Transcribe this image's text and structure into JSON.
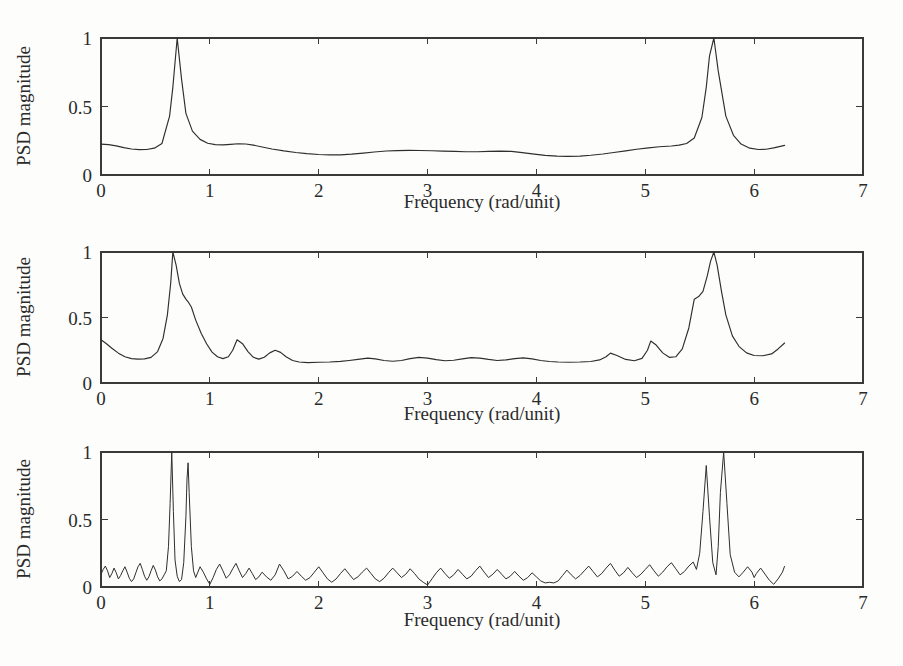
{
  "figure": {
    "width": 903,
    "height": 666,
    "background": "#fdfdfc",
    "line_color": "#2e2e2e",
    "axis_color": "#3a3a3a",
    "text_color": "#2b2b2b"
  },
  "labels": {
    "xlabel": "Frequency (rad/unit)",
    "ylabel": "PSD magnitude",
    "xticks": [
      "0",
      "1",
      "2",
      "3",
      "4",
      "5",
      "6",
      "7"
    ],
    "yticks": [
      "0",
      "0.5",
      "1"
    ]
  },
  "chart_data": [
    {
      "type": "line",
      "panel": 1,
      "title": "",
      "xlabel": "Frequency (rad/unit)",
      "ylabel": "PSD magnitude",
      "xlim": [
        0,
        7
      ],
      "ylim": [
        0,
        1
      ],
      "xticks": [
        0,
        1,
        2,
        3,
        4,
        5,
        6,
        7
      ],
      "yticks": [
        0,
        0.5,
        1
      ],
      "grid": false,
      "legend": null,
      "data_x_range": [
        0,
        6.283
      ],
      "description": "Low-resolution smooth PSD estimate with two broad resonance peaks",
      "peaks": [
        {
          "x": 0.7,
          "y": 1.0
        },
        {
          "x": 5.59,
          "y": 1.0
        }
      ],
      "x": [
        0.0,
        0.07,
        0.14,
        0.21,
        0.28,
        0.35,
        0.42,
        0.49,
        0.56,
        0.63,
        0.66,
        0.7,
        0.74,
        0.78,
        0.84,
        0.91,
        0.98,
        1.05,
        1.12,
        1.19,
        1.26,
        1.33,
        1.4,
        1.47,
        1.57,
        1.68,
        1.79,
        1.89,
        2.0,
        2.1,
        2.2,
        2.3,
        2.41,
        2.51,
        2.62,
        2.72,
        2.83,
        2.93,
        3.04,
        3.14,
        3.25,
        3.35,
        3.46,
        3.56,
        3.67,
        3.77,
        3.87,
        3.98,
        4.08,
        4.19,
        4.29,
        4.4,
        4.5,
        4.61,
        4.71,
        4.82,
        4.92,
        5.03,
        5.13,
        5.24,
        5.31,
        5.38,
        5.45,
        5.52,
        5.56,
        5.59,
        5.63,
        5.67,
        5.74,
        5.81,
        5.88,
        5.96,
        6.04,
        6.11,
        6.18,
        6.28
      ],
      "y": [
        0.225,
        0.222,
        0.213,
        0.2,
        0.19,
        0.185,
        0.186,
        0.196,
        0.23,
        0.43,
        0.64,
        1.0,
        0.7,
        0.45,
        0.32,
        0.26,
        0.232,
        0.222,
        0.22,
        0.224,
        0.228,
        0.226,
        0.218,
        0.206,
        0.19,
        0.176,
        0.164,
        0.156,
        0.15,
        0.147,
        0.147,
        0.152,
        0.16,
        0.168,
        0.175,
        0.178,
        0.18,
        0.179,
        0.177,
        0.174,
        0.172,
        0.17,
        0.17,
        0.172,
        0.174,
        0.172,
        0.163,
        0.152,
        0.143,
        0.138,
        0.136,
        0.138,
        0.144,
        0.153,
        0.164,
        0.176,
        0.188,
        0.198,
        0.206,
        0.212,
        0.218,
        0.23,
        0.27,
        0.42,
        0.64,
        0.87,
        1.0,
        0.76,
        0.43,
        0.29,
        0.226,
        0.196,
        0.186,
        0.188,
        0.198,
        0.216
      ]
    },
    {
      "type": "line",
      "panel": 2,
      "title": "",
      "xlabel": "Frequency (rad/unit)",
      "ylabel": "PSD magnitude",
      "xlim": [
        0,
        7
      ],
      "ylim": [
        0,
        1
      ],
      "xticks": [
        0,
        1,
        2,
        3,
        4,
        5,
        6,
        7
      ],
      "yticks": [
        0,
        0.5,
        1
      ],
      "grid": false,
      "legend": null,
      "data_x_range": [
        0,
        6.283
      ],
      "description": "Medium-resolution PSD estimate showing two main peaks with shoulders and sidelobe ripples",
      "peaks": [
        {
          "x": 0.66,
          "y": 1.0
        },
        {
          "x": 0.8,
          "y": 0.62
        },
        {
          "x": 1.25,
          "y": 0.33
        },
        {
          "x": 1.6,
          "y": 0.25
        },
        {
          "x": 4.68,
          "y": 0.23
        },
        {
          "x": 5.05,
          "y": 0.32
        },
        {
          "x": 5.45,
          "y": 0.66
        },
        {
          "x": 5.63,
          "y": 1.0
        }
      ],
      "x": [
        0.0,
        0.05,
        0.1,
        0.16,
        0.22,
        0.28,
        0.34,
        0.4,
        0.46,
        0.52,
        0.57,
        0.61,
        0.64,
        0.66,
        0.69,
        0.72,
        0.75,
        0.78,
        0.8,
        0.83,
        0.87,
        0.92,
        0.97,
        1.02,
        1.07,
        1.12,
        1.17,
        1.21,
        1.25,
        1.3,
        1.35,
        1.4,
        1.45,
        1.5,
        1.55,
        1.6,
        1.65,
        1.7,
        1.76,
        1.82,
        1.9,
        2.0,
        2.1,
        2.2,
        2.28,
        2.36,
        2.45,
        2.52,
        2.6,
        2.68,
        2.76,
        2.84,
        2.92,
        3.0,
        3.08,
        3.16,
        3.24,
        3.32,
        3.4,
        3.48,
        3.56,
        3.64,
        3.72,
        3.8,
        3.88,
        3.96,
        4.04,
        4.12,
        4.2,
        4.3,
        4.4,
        4.5,
        4.58,
        4.64,
        4.68,
        4.74,
        4.82,
        4.9,
        4.97,
        5.02,
        5.05,
        5.1,
        5.16,
        5.22,
        5.28,
        5.34,
        5.4,
        5.45,
        5.49,
        5.53,
        5.57,
        5.6,
        5.63,
        5.66,
        5.7,
        5.74,
        5.8,
        5.86,
        5.93,
        6.0,
        6.08,
        6.16,
        6.22,
        6.28
      ],
      "y": [
        0.33,
        0.3,
        0.265,
        0.228,
        0.2,
        0.186,
        0.182,
        0.184,
        0.196,
        0.24,
        0.34,
        0.52,
        0.76,
        1.0,
        0.9,
        0.76,
        0.68,
        0.64,
        0.62,
        0.58,
        0.48,
        0.38,
        0.3,
        0.236,
        0.2,
        0.186,
        0.2,
        0.25,
        0.33,
        0.3,
        0.24,
        0.196,
        0.182,
        0.196,
        0.23,
        0.25,
        0.234,
        0.2,
        0.172,
        0.16,
        0.156,
        0.158,
        0.16,
        0.165,
        0.172,
        0.18,
        0.19,
        0.184,
        0.172,
        0.166,
        0.172,
        0.186,
        0.196,
        0.19,
        0.178,
        0.17,
        0.174,
        0.184,
        0.194,
        0.19,
        0.18,
        0.172,
        0.176,
        0.186,
        0.192,
        0.184,
        0.172,
        0.164,
        0.16,
        0.158,
        0.16,
        0.164,
        0.176,
        0.2,
        0.228,
        0.21,
        0.18,
        0.17,
        0.188,
        0.25,
        0.32,
        0.29,
        0.23,
        0.196,
        0.2,
        0.26,
        0.42,
        0.64,
        0.66,
        0.7,
        0.82,
        0.93,
        1.0,
        0.9,
        0.7,
        0.52,
        0.36,
        0.28,
        0.23,
        0.21,
        0.208,
        0.222,
        0.26,
        0.305
      ]
    },
    {
      "type": "line",
      "panel": 3,
      "title": "",
      "xlabel": "Frequency (rad/unit)",
      "ylabel": "PSD magnitude",
      "xlim": [
        0,
        7
      ],
      "ylim": [
        0,
        1
      ],
      "xticks": [
        0,
        1,
        2,
        3,
        4,
        5,
        6,
        7
      ],
      "yticks": [
        0,
        0.5,
        1
      ],
      "grid": false,
      "legend": null,
      "data_x_range": [
        0,
        6.283
      ],
      "description": "High-resolution periodogram: dense noisy spikes with four sharp line components",
      "peaks": [
        {
          "x": 0.65,
          "y": 1.0
        },
        {
          "x": 0.8,
          "y": 0.92
        },
        {
          "x": 5.5,
          "y": 0.9
        },
        {
          "x": 5.67,
          "y": 1.0
        }
      ],
      "noise_floor": [
        0.03,
        0.19
      ],
      "x": [
        0.0,
        0.02,
        0.04,
        0.06,
        0.08,
        0.1,
        0.12,
        0.14,
        0.16,
        0.18,
        0.2,
        0.22,
        0.24,
        0.26,
        0.28,
        0.3,
        0.32,
        0.34,
        0.36,
        0.38,
        0.4,
        0.42,
        0.44,
        0.46,
        0.48,
        0.5,
        0.52,
        0.54,
        0.56,
        0.58,
        0.6,
        0.62,
        0.635,
        0.65,
        0.665,
        0.68,
        0.7,
        0.72,
        0.74,
        0.76,
        0.78,
        0.79,
        0.8,
        0.81,
        0.83,
        0.85,
        0.87,
        0.89,
        0.91,
        0.94,
        0.97,
        1.0,
        1.03,
        1.06,
        1.09,
        1.12,
        1.15,
        1.18,
        1.21,
        1.24,
        1.27,
        1.3,
        1.33,
        1.36,
        1.39,
        1.42,
        1.45,
        1.48,
        1.52,
        1.56,
        1.6,
        1.64,
        1.68,
        1.72,
        1.76,
        1.8,
        1.84,
        1.88,
        1.92,
        1.96,
        2.0,
        2.04,
        2.08,
        2.12,
        2.16,
        2.2,
        2.24,
        2.28,
        2.32,
        2.36,
        2.4,
        2.44,
        2.48,
        2.52,
        2.56,
        2.6,
        2.64,
        2.68,
        2.72,
        2.76,
        2.8,
        2.84,
        2.88,
        2.92,
        2.96,
        3.0,
        3.04,
        3.08,
        3.12,
        3.16,
        3.2,
        3.24,
        3.28,
        3.32,
        3.36,
        3.4,
        3.44,
        3.48,
        3.52,
        3.56,
        3.6,
        3.64,
        3.68,
        3.72,
        3.76,
        3.8,
        3.84,
        3.88,
        3.92,
        3.96,
        4.0,
        4.04,
        4.08,
        4.12,
        4.16,
        4.2,
        4.24,
        4.28,
        4.32,
        4.36,
        4.4,
        4.44,
        4.48,
        4.52,
        4.56,
        4.6,
        4.64,
        4.68,
        4.72,
        4.76,
        4.8,
        4.84,
        4.88,
        4.92,
        4.96,
        5.0,
        5.04,
        5.08,
        5.12,
        5.16,
        5.2,
        5.24,
        5.28,
        5.32,
        5.36,
        5.4,
        5.44,
        5.47,
        5.5,
        5.53,
        5.56,
        5.59,
        5.62,
        5.65,
        5.67,
        5.69,
        5.72,
        5.75,
        5.78,
        5.82,
        5.86,
        5.9,
        5.94,
        5.98,
        6.0,
        6.02,
        6.06,
        6.1,
        6.14,
        6.18,
        6.22,
        6.26,
        6.28
      ],
      "y": [
        0.095,
        0.13,
        0.155,
        0.12,
        0.07,
        0.1,
        0.14,
        0.105,
        0.06,
        0.085,
        0.12,
        0.15,
        0.11,
        0.065,
        0.04,
        0.06,
        0.105,
        0.15,
        0.175,
        0.13,
        0.08,
        0.05,
        0.075,
        0.12,
        0.16,
        0.125,
        0.075,
        0.045,
        0.06,
        0.09,
        0.12,
        0.3,
        0.62,
        1.0,
        0.56,
        0.2,
        0.08,
        0.04,
        0.055,
        0.18,
        0.52,
        0.8,
        0.92,
        0.7,
        0.3,
        0.12,
        0.07,
        0.11,
        0.15,
        0.11,
        0.06,
        0.02,
        0.07,
        0.13,
        0.17,
        0.12,
        0.065,
        0.09,
        0.135,
        0.175,
        0.12,
        0.07,
        0.1,
        0.14,
        0.1,
        0.055,
        0.075,
        0.11,
        0.075,
        0.05,
        0.09,
        0.17,
        0.12,
        0.06,
        0.08,
        0.115,
        0.08,
        0.05,
        0.07,
        0.11,
        0.15,
        0.105,
        0.06,
        0.035,
        0.06,
        0.1,
        0.135,
        0.095,
        0.055,
        0.075,
        0.11,
        0.14,
        0.1,
        0.06,
        0.04,
        0.065,
        0.105,
        0.14,
        0.105,
        0.07,
        0.095,
        0.135,
        0.1,
        0.06,
        0.035,
        0.015,
        0.06,
        0.105,
        0.14,
        0.1,
        0.065,
        0.09,
        0.13,
        0.095,
        0.06,
        0.08,
        0.12,
        0.155,
        0.11,
        0.07,
        0.095,
        0.13,
        0.095,
        0.06,
        0.08,
        0.115,
        0.08,
        0.05,
        0.07,
        0.105,
        0.075,
        0.045,
        0.03,
        0.035,
        0.03,
        0.045,
        0.085,
        0.125,
        0.09,
        0.06,
        0.085,
        0.12,
        0.155,
        0.115,
        0.075,
        0.1,
        0.14,
        0.175,
        0.125,
        0.08,
        0.105,
        0.145,
        0.105,
        0.07,
        0.095,
        0.13,
        0.165,
        0.12,
        0.08,
        0.11,
        0.15,
        0.18,
        0.135,
        0.09,
        0.115,
        0.155,
        0.185,
        0.13,
        0.25,
        0.56,
        0.9,
        0.52,
        0.18,
        0.09,
        0.3,
        0.7,
        1.0,
        0.62,
        0.24,
        0.11,
        0.075,
        0.11,
        0.15,
        0.11,
        0.07,
        0.1,
        0.14,
        0.095,
        0.05,
        0.02,
        0.06,
        0.11,
        0.155,
        0.12,
        0.08,
        0.11,
        0.145,
        0.115
      ]
    }
  ]
}
